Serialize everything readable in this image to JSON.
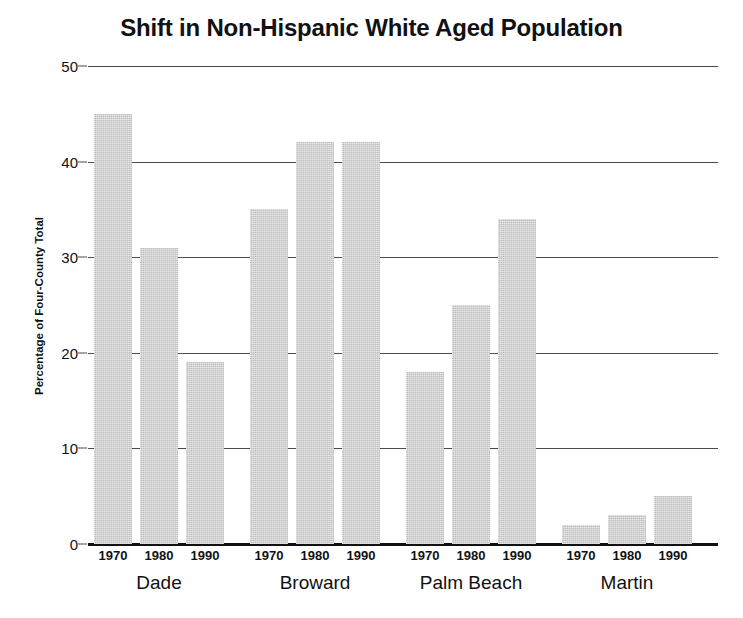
{
  "chart_data": {
    "type": "bar",
    "title": "Shift in Non-Hispanic White Aged Population",
    "xlabel": "",
    "ylabel": "Percentage of Four-County Total",
    "ylim": [
      0,
      50
    ],
    "yticks": [
      0,
      10,
      20,
      30,
      40,
      50
    ],
    "ytick_labels": [
      "0",
      "10",
      "20",
      "30",
      "40",
      "50"
    ],
    "grid": true,
    "legend": "none",
    "categories": [
      "Dade",
      "Broward",
      "Palm Beach",
      "Martin"
    ],
    "subcategories": [
      "1970",
      "1980",
      "1990"
    ],
    "series": [
      {
        "name": "1970",
        "values": [
          45,
          35,
          18,
          2
        ]
      },
      {
        "name": "1980",
        "values": [
          31,
          42,
          25,
          3
        ]
      },
      {
        "name": "1990",
        "values": [
          19,
          42,
          34,
          5
        ]
      }
    ],
    "bars": [
      {
        "group": "Dade",
        "year": "1970",
        "value": 45
      },
      {
        "group": "Dade",
        "year": "1980",
        "value": 31
      },
      {
        "group": "Dade",
        "year": "1990",
        "value": 19
      },
      {
        "group": "Broward",
        "year": "1970",
        "value": 35
      },
      {
        "group": "Broward",
        "year": "1980",
        "value": 42
      },
      {
        "group": "Broward",
        "year": "1990",
        "value": 42
      },
      {
        "group": "Palm Beach",
        "year": "1970",
        "value": 18
      },
      {
        "group": "Palm Beach",
        "year": "1980",
        "value": 25
      },
      {
        "group": "Palm Beach",
        "year": "1990",
        "value": 34
      },
      {
        "group": "Martin",
        "year": "1970",
        "value": 2
      },
      {
        "group": "Martin",
        "year": "1980",
        "value": 3
      },
      {
        "group": "Martin",
        "year": "1990",
        "value": 5
      }
    ],
    "colors": {
      "bar_fill": "#bdbdbd",
      "gridline": "#4a4a4a",
      "axis": "#111111",
      "background": "#ffffff",
      "text": "#111111"
    }
  },
  "layout": {
    "plot_left": 88,
    "plot_right": 718,
    "plot_top": 66,
    "plot_bottom": 544,
    "bar_width": 38,
    "bar_gap": 8,
    "group_gap": 26
  }
}
